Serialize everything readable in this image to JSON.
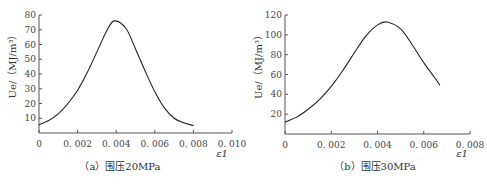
{
  "chart_data": [
    {
      "type": "line",
      "title": "",
      "caption": "(a) 围压20MPa",
      "xlabel": "ε1",
      "ylabel": "Ue/(MJ/m³)",
      "xlim": [
        0,
        0.01
      ],
      "ylim": [
        0,
        80
      ],
      "xticks": [
        "0",
        "0.002",
        "0.004",
        "0.006",
        "0.008",
        "0.010"
      ],
      "yticks": [
        "10",
        "20",
        "30",
        "40",
        "50",
        "60",
        "70",
        "80"
      ],
      "grid": false,
      "series": [
        {
          "name": "Ue",
          "x": [
            0,
            0.0005,
            0.001,
            0.0015,
            0.002,
            0.0025,
            0.003,
            0.0035,
            0.0039,
            0.0045,
            0.005,
            0.0055,
            0.006,
            0.0065,
            0.007,
            0.0075,
            0.008
          ],
          "y": [
            5.5,
            8.5,
            13,
            20,
            29,
            41,
            55,
            69,
            76,
            71,
            57,
            42,
            28,
            17,
            10,
            7,
            5
          ]
        }
      ]
    },
    {
      "type": "line",
      "title": "",
      "caption": "(b) 围压30MPa",
      "xlabel": "ε1",
      "ylabel": "Ue/(MJ/m³)",
      "xlim": [
        0,
        0.008
      ],
      "ylim": [
        0,
        120
      ],
      "xticks": [
        "0",
        "0.002",
        "0.004",
        "0.006",
        "0.008"
      ],
      "yticks": [
        "20",
        "40",
        "60",
        "80",
        "100",
        "120"
      ],
      "grid": false,
      "series": [
        {
          "name": "Ue",
          "x": [
            0,
            0.0005,
            0.001,
            0.0015,
            0.002,
            0.0025,
            0.003,
            0.0035,
            0.004,
            0.0044,
            0.005,
            0.0055,
            0.006,
            0.0065,
            0.0067
          ],
          "y": [
            12,
            17,
            25,
            35,
            48,
            64,
            82,
            99,
            110,
            113,
            106,
            90,
            72,
            56,
            49
          ]
        }
      ]
    }
  ],
  "labels": {
    "left_caption": "（a）围压20MPa",
    "right_caption": "（b）围压30MPa",
    "x_axis_label": "ε1",
    "y_axis_label": "Ue/（MJ/m³）"
  },
  "colors": {
    "curve": "#222222",
    "axis": "#555555"
  }
}
